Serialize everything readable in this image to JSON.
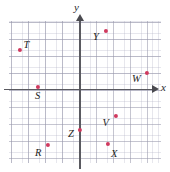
{
  "figure": {
    "type": "coordinate-plane",
    "background_color": "#ffffff",
    "point_color": "#d0395e",
    "axis_color": "#5a5a60",
    "grid_major_color": "#9696aa",
    "grid_minor_color": "#afafc3"
  },
  "axes": {
    "x_label": "x",
    "y_label": "y",
    "origin_px": {
      "x": 80,
      "y": 89
    },
    "grid_major_spacing_px": 17,
    "grid_minor_spacing_px": 5.66,
    "arrowheads": [
      "x-positive",
      "y-positive"
    ]
  },
  "chart_data": {
    "type": "scatter",
    "title": "",
    "xlabel": "x",
    "ylabel": "y",
    "grid": true,
    "legend": null,
    "xlim": [
      -4.2,
      4.8
    ],
    "ylim": [
      -4.4,
      4.0
    ],
    "points": [
      {
        "label": "T",
        "x": -3.6,
        "y": 2.3,
        "px": 19.5,
        "py": 50.0,
        "label_dx": 4,
        "label_dy": -10
      },
      {
        "label": "Y",
        "x": 1.5,
        "y": 3.4,
        "px": 106.0,
        "py": 31.0,
        "label_dx": -13,
        "label_dy": 1
      },
      {
        "label": "W",
        "x": 3.9,
        "y": 0.9,
        "px": 147.0,
        "py": 73.0,
        "label_dx": -15,
        "label_dy": 1
      },
      {
        "label": "S",
        "x": -2.5,
        "y": 0.1,
        "px": 38.0,
        "py": 86.5,
        "label_dx": -3,
        "label_dy": 4
      },
      {
        "label": "V",
        "x": 2.1,
        "y": -1.6,
        "px": 115.5,
        "py": 116.0,
        "label_dx": -13,
        "label_dy": 2
      },
      {
        "label": "Z",
        "x": 0.0,
        "y": -2.4,
        "px": 80.0,
        "py": 130.0,
        "label_dx": -12,
        "label_dy": -1
      },
      {
        "label": "R",
        "x": -1.9,
        "y": -3.3,
        "px": 48.0,
        "py": 145.0,
        "label_dx": -13,
        "label_dy": 3
      },
      {
        "label": "X",
        "x": 1.7,
        "y": -3.2,
        "px": 108.0,
        "py": 143.5,
        "label_dx": 3,
        "label_dy": 5
      }
    ]
  }
}
